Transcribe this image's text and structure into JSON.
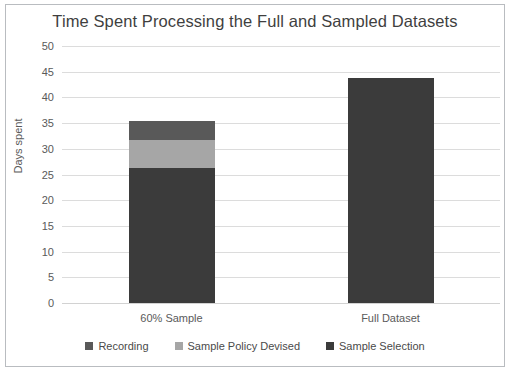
{
  "chart_data": {
    "type": "bar",
    "subtype": "stacked-column",
    "title": "Time Spent Processing the Full and Sampled Datasets",
    "xlabel": "",
    "ylabel": "Days spent",
    "categories": [
      "60% Sample",
      "Full Dataset"
    ],
    "ylim": [
      0,
      50
    ],
    "yticks": [
      0,
      5,
      10,
      15,
      20,
      25,
      30,
      35,
      40,
      45,
      50
    ],
    "ytick_labels": [
      "0",
      "5",
      "10",
      "15",
      "20",
      "25",
      "30",
      "35",
      "40",
      "45",
      "50"
    ],
    "grid": true,
    "grid_axis": "y",
    "legend_position": "bottom",
    "series": [
      {
        "name": "Sample Selection",
        "color": "#3b3b3b",
        "values": [
          26.2,
          43.7
        ]
      },
      {
        "name": "Sample Policy Devised",
        "color": "#a6a6a6",
        "values": [
          5.6,
          0
        ]
      },
      {
        "name": "Recording",
        "color": "#595959",
        "values": [
          3.6,
          0
        ]
      }
    ],
    "stack_order_bottom_to_top": [
      "Sample Selection",
      "Sample Policy Devised",
      "Recording"
    ],
    "totals": [
      35.4,
      43.7
    ],
    "legend_entries": [
      {
        "label": "Recording",
        "color": "#595959"
      },
      {
        "label": "Sample Policy Devised",
        "color": "#a6a6a6"
      },
      {
        "label": "Sample Selection",
        "color": "#3b3b3b"
      }
    ]
  },
  "colors": {
    "background": "#ffffff",
    "border": "#b9bcc0",
    "gridline": "#dcdcdc",
    "text": "#5a5a5a",
    "title_text": "#3f3f3f"
  }
}
